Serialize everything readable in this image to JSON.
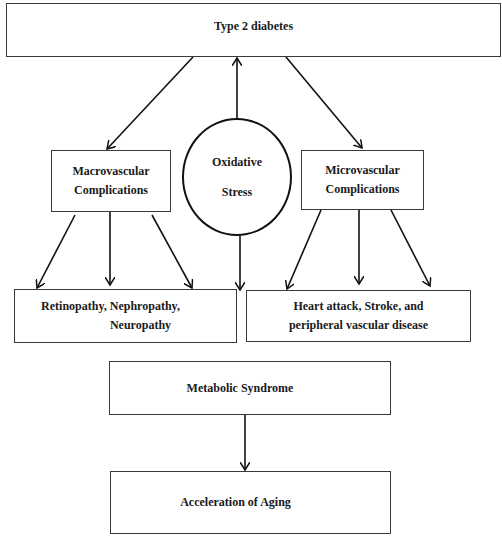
{
  "diagram": {
    "nodes": {
      "type2": {
        "lines": [
          "Type 2 diabetes"
        ]
      },
      "macro": {
        "lines": [
          "Macrovascular",
          "Complications"
        ]
      },
      "oxidative": {
        "lines": [
          "Oxidative",
          "Stress"
        ]
      },
      "micro": {
        "lines": [
          "Microvascular",
          "Complications"
        ]
      },
      "retino": {
        "lines": [
          "Retinopathy, Nephropathy,",
          "Neuropathy"
        ]
      },
      "heart": {
        "lines": [
          "Heart attack, Stroke, and",
          "peripheral vascular disease"
        ]
      },
      "metabolic": {
        "lines": [
          "Metabolic Syndrome"
        ]
      },
      "aging": {
        "lines": [
          "Acceleration of Aging"
        ]
      }
    },
    "edges": [
      {
        "from": "Type 2 diabetes",
        "to": "Macrovascular Complications"
      },
      {
        "from": "Type 2 diabetes",
        "to": "Microvascular Complications"
      },
      {
        "from": "Oxidative Stress",
        "to": "Type 2 diabetes"
      },
      {
        "from": "Oxidative Stress",
        "to": "lower row (between boxes)"
      },
      {
        "from": "Macrovascular Complications",
        "to": "Retinopathy, Nephropathy, Neuropathy",
        "count": 3
      },
      {
        "from": "Microvascular Complications",
        "to": "Heart attack, Stroke, and peripheral vascular disease",
        "count": 3
      },
      {
        "from": "Metabolic Syndrome",
        "to": "Acceleration of Aging"
      }
    ],
    "colors": {
      "stroke": "#111111",
      "box_border": "#3a3a3a",
      "background": "#ffffff",
      "text": "#1a1a1a"
    }
  }
}
